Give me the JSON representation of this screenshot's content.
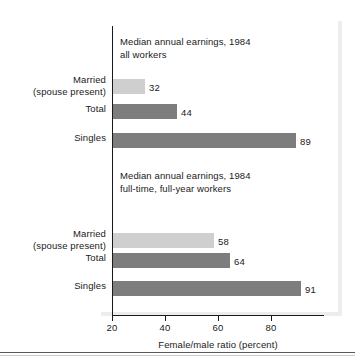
{
  "chart_data": {
    "type": "bar",
    "orientation": "horizontal",
    "title": "",
    "xlabel": "Female/male ratio (percent)",
    "ylabel": "",
    "xlim": [
      20,
      100
    ],
    "grid": false,
    "legend": "none",
    "xticks": [
      20,
      40,
      60,
      80
    ],
    "xtick_labels": [
      "20",
      "40",
      "60",
      "80"
    ],
    "groups": [
      {
        "caption": "Median annual earnings, 1984\nall workers",
        "categories": [
          "Married\n(spouse present)",
          "Total",
          "Singles"
        ],
        "values": [
          32,
          44,
          89
        ],
        "value_labels": [
          "32",
          "44",
          "89"
        ],
        "colors": [
          "#cfcfcf",
          "#7d7d7d",
          "#7d7d7d"
        ]
      },
      {
        "caption": "Median annual earnings, 1984\nfull-time, full-year workers",
        "categories": [
          "Married\n(spouse present)",
          "Total",
          "Singles"
        ],
        "values": [
          58,
          64,
          91
        ],
        "value_labels": [
          "58",
          "64",
          "91"
        ],
        "colors": [
          "#cfcfcf",
          "#7d7d7d",
          "#7d7d7d"
        ]
      }
    ],
    "colors": {
      "bar_light": "#cfcfcf",
      "bar_dark": "#7d7d7d",
      "axis": "#1a1a1a",
      "background": "#ffffff",
      "frame_shadow": "#ededed",
      "rule": "#55585c"
    }
  }
}
